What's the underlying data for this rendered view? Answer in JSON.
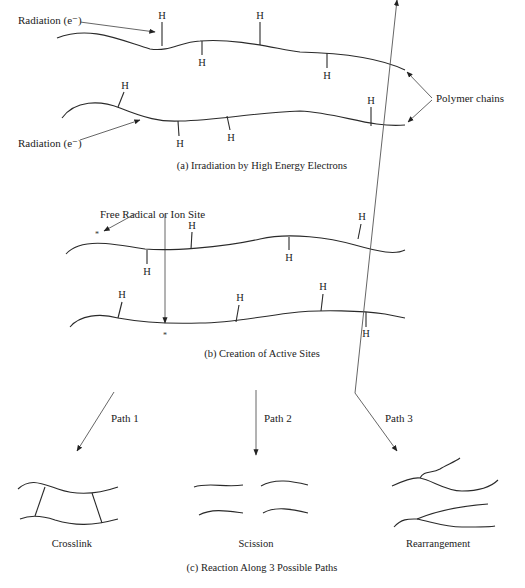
{
  "panel_a": {
    "radiation_label_top": "Radiation (e⁻)",
    "radiation_label_bottom": "Radiation (e⁻)",
    "polymer_label": "Polymer chains",
    "hydrogen": "H",
    "caption": "(a) Irradiation by High Energy Electrons"
  },
  "panel_b": {
    "site_label": "Free Radical or Ion Site",
    "site_marker": "*",
    "hydrogen": "H",
    "caption": "(b) Creation of Active Sites"
  },
  "panel_c": {
    "paths": [
      {
        "label": "Path 1",
        "result": "Crosslink"
      },
      {
        "label": "Path 2",
        "result": "Scission"
      },
      {
        "label": "Path 3",
        "result": "Rearrangement"
      }
    ],
    "caption": "(c) Reaction Along 3 Possible Paths"
  }
}
